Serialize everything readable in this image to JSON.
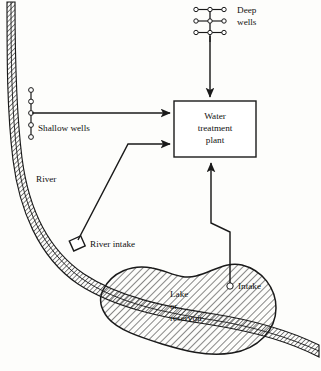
{
  "figure": {
    "type": "schematic-diagram",
    "background_color": "#fdfdfb",
    "line_color": "#1a1a1a"
  },
  "labels": {
    "deep_wells": "Deep\nwells",
    "deep_wells_line1": "Deep",
    "deep_wells_line2": "wells",
    "shallow_wells": "Shallow wells",
    "river": "River",
    "river_intake": "River intake",
    "intake": "Intake",
    "plant_line1": "Water",
    "plant_line2": "treatment",
    "plant_line3": "plant",
    "lake_line1": "Lake",
    "lake_line2": "or",
    "lake_line3": "reservoir"
  },
  "nodes": {
    "deep_wells": {
      "rows": 3,
      "circles_per_row": 3,
      "circle_radius": 2.2,
      "arrow_to": "water-treatment-plant",
      "arrow_direction": "down"
    },
    "shallow_wells": {
      "circle_count": 5,
      "circle_radius": 2.4,
      "arrow_to": "water-treatment-plant",
      "arrow_direction": "right"
    },
    "water_treatment_plant": {
      "shape": "rectangle",
      "x": 174,
      "y": 101,
      "width": 82,
      "height": 56,
      "inputs": [
        "deep-wells",
        "shallow-wells",
        "river-intake",
        "lake-intake"
      ]
    },
    "river_intake": {
      "shape": "small-rectangle",
      "arrow_to": "water-treatment-plant",
      "arrow_direction": "right"
    },
    "lake_intake": {
      "shape": "circle",
      "circle_radius": 3.2,
      "arrow_to": "water-treatment-plant",
      "arrow_direction": "up"
    },
    "lake": {
      "shape": "blob",
      "fill": "diagonal-hatch"
    },
    "river": {
      "shape": "curved-band",
      "fill": "diagonal-hatch",
      "course": "vertical at upper-left, curving to horizontal at lower-right"
    }
  },
  "colors": {
    "ink": "#1a1a1a",
    "paper": "#fdfdfb",
    "hatch": "#1a1a1a"
  }
}
